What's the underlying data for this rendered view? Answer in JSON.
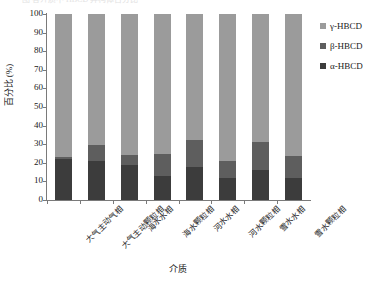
{
  "top_caption_fragment": "图  各介质中 HBCD 异构体百分比",
  "chart_data": {
    "type": "bar",
    "stacked": true,
    "title": "",
    "xlabel": "介质",
    "ylabel": "百分比 (%)",
    "ylim": [
      0,
      100
    ],
    "ytick_step": 10,
    "ytick_labels": [
      "0",
      "10",
      "20",
      "30",
      "40",
      "50",
      "60",
      "70",
      "80",
      "90",
      "100"
    ],
    "grid": false,
    "legend_position": "right",
    "categories": [
      "大气主动气相",
      "大气主动颗粒相",
      "海水水相",
      "海水颗粒相",
      "河水水相",
      "河水颗粒相",
      "雪水水相",
      "雪水颗粒相"
    ],
    "series": [
      {
        "name": "α-HBCD",
        "color": "#3c3c3c",
        "values": [
          22.0,
          21.0,
          19.0,
          13.0,
          17.5,
          12.0,
          16.0,
          12.0
        ]
      },
      {
        "name": "β-HBCD",
        "color": "#5e5e5e",
        "values": [
          1.0,
          8.5,
          5.0,
          12.0,
          14.5,
          9.0,
          15.0,
          11.5
        ]
      },
      {
        "name": "γ-HBCD",
        "color": "#9b9b9b",
        "values": [
          77.0,
          70.5,
          76.0,
          75.0,
          68.0,
          79.0,
          69.0,
          76.5
        ]
      }
    ],
    "legend_entries": [
      "γ-HBCD",
      "β-HBCD",
      "α-HBCD"
    ],
    "axis_color": "#7a7a7a"
  }
}
